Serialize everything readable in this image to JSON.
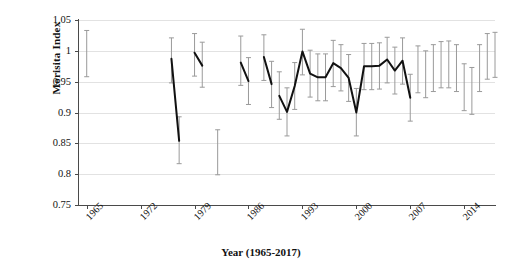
{
  "chart_data": {
    "type": "line",
    "title": "",
    "xlabel": "Year (1965-2017)",
    "ylabel": "Morisita Index",
    "xlim": [
      1964,
      2018
    ],
    "ylim": [
      0.75,
      1.05
    ],
    "grid": true,
    "legend": "none",
    "marker": "filled-circle",
    "error_bars": "vertical",
    "y_ticks": [
      "0.75",
      "0.8",
      "0.85",
      "0.9",
      "0.95",
      "1",
      "1.05"
    ],
    "y_tick_values": [
      0.75,
      0.8,
      0.85,
      0.9,
      0.95,
      1.0,
      1.05
    ],
    "x_ticks": [
      "1965",
      "1972",
      "1979",
      "1986",
      "1993",
      "2000",
      "2007",
      "2014"
    ],
    "x_tick_values": [
      1965,
      1972,
      1979,
      1986,
      1993,
      2000,
      2007,
      2014
    ],
    "colors": {
      "marker": "#111111",
      "line": "#111111",
      "error_bar": "#9a9a9a",
      "grid": "#e2e2e2",
      "axis": "#4a4a4a"
    },
    "segments": [
      [
        0
      ],
      [
        1,
        2
      ],
      [
        3,
        4
      ],
      [
        5
      ],
      [
        6,
        7
      ],
      [
        8,
        9
      ],
      [
        10,
        11,
        12,
        13,
        14,
        15,
        16,
        17,
        18,
        19,
        20,
        21,
        22,
        23,
        24,
        25,
        26,
        27
      ],
      [
        28,
        29,
        30,
        31,
        32,
        33,
        34,
        35,
        36,
        37,
        38,
        39,
        40,
        41,
        42,
        43,
        44,
        45,
        46
      ]
    ],
    "points": [
      {
        "year": 1965,
        "value": 0.998,
        "low": 0.958,
        "high": 1.033
      },
      {
        "year": 1976,
        "value": 0.987,
        "low": 0.948,
        "high": 1.021
      },
      {
        "year": 1977,
        "value": 0.854,
        "low": 0.817,
        "high": 0.893
      },
      {
        "year": 1979,
        "value": 0.997,
        "low": 0.959,
        "high": 1.028
      },
      {
        "year": 1980,
        "value": 0.976,
        "low": 0.941,
        "high": 1.014
      },
      {
        "year": 1982,
        "value": 0.836,
        "low": 0.799,
        "high": 0.872
      },
      {
        "year": 1985,
        "value": 0.981,
        "low": 0.944,
        "high": 1.024
      },
      {
        "year": 1986,
        "value": 0.951,
        "low": 0.913,
        "high": 0.989
      },
      {
        "year": 1988,
        "value": 0.99,
        "low": 0.952,
        "high": 1.026
      },
      {
        "year": 1989,
        "value": 0.946,
        "low": 0.908,
        "high": 0.983
      },
      {
        "year": 1990,
        "value": 0.927,
        "low": 0.889,
        "high": 0.966
      },
      {
        "year": 1991,
        "value": 0.901,
        "low": 0.862,
        "high": 0.94
      },
      {
        "year": 1992,
        "value": 0.943,
        "low": 0.905,
        "high": 0.981
      },
      {
        "year": 1993,
        "value": 0.999,
        "low": 0.961,
        "high": 1.035
      },
      {
        "year": 1994,
        "value": 0.963,
        "low": 0.925,
        "high": 1.001
      },
      {
        "year": 1995,
        "value": 0.957,
        "low": 0.919,
        "high": 0.995
      },
      {
        "year": 1996,
        "value": 0.957,
        "low": 0.919,
        "high": 0.995
      },
      {
        "year": 1997,
        "value": 0.98,
        "low": 0.942,
        "high": 1.017
      },
      {
        "year": 1998,
        "value": 0.972,
        "low": 0.935,
        "high": 1.01
      },
      {
        "year": 1999,
        "value": 0.956,
        "low": 0.918,
        "high": 0.994
      },
      {
        "year": 2000,
        "value": 0.9,
        "low": 0.862,
        "high": 0.939
      },
      {
        "year": 2001,
        "value": 0.975,
        "low": 0.937,
        "high": 1.012
      },
      {
        "year": 2002,
        "value": 0.975,
        "low": 0.937,
        "high": 1.012
      },
      {
        "year": 2003,
        "value": 0.976,
        "low": 0.938,
        "high": 1.013
      },
      {
        "year": 2004,
        "value": 0.986,
        "low": 0.948,
        "high": 1.022
      },
      {
        "year": 2005,
        "value": 0.968,
        "low": 0.93,
        "high": 1.006
      },
      {
        "year": 2006,
        "value": 0.984,
        "low": 0.946,
        "high": 1.021
      },
      {
        "year": 2007,
        "value": 0.924,
        "low": 0.886,
        "high": 0.962
      },
      {
        "year": 2008,
        "value": 0.97,
        "low": 0.932,
        "high": 1.008
      },
      {
        "year": 2009,
        "value": 0.962,
        "low": 0.924,
        "high": 1.0
      },
      {
        "year": 2010,
        "value": 0.972,
        "low": 0.934,
        "high": 1.01
      },
      {
        "year": 2011,
        "value": 0.978,
        "low": 0.94,
        "high": 1.015
      },
      {
        "year": 2012,
        "value": 0.978,
        "low": 0.94,
        "high": 1.016
      },
      {
        "year": 2013,
        "value": 0.972,
        "low": 0.934,
        "high": 1.01
      },
      {
        "year": 2014,
        "value": 0.941,
        "low": 0.903,
        "high": 0.979
      },
      {
        "year": 2015,
        "value": 0.935,
        "low": 0.897,
        "high": 0.973
      },
      {
        "year": 2016,
        "value": 0.972,
        "low": 0.934,
        "high": 1.01
      },
      {
        "year": 2017,
        "value": 0.992,
        "low": 0.954,
        "high": 1.028
      },
      {
        "year": 2018,
        "value": 0.995,
        "low": 0.957,
        "high": 1.03
      }
    ]
  }
}
